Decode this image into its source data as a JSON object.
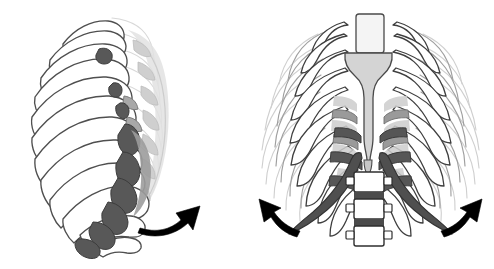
{
  "figure": {
    "caption": "Lateral and anterior views of the thoracic cage with arrows indicating rib elevation",
    "background_color": "#ffffff",
    "width": 494,
    "height": 269
  },
  "palette": {
    "background": "#ffffff",
    "bone_fill": "#ffffff",
    "bone_outline": "#4a4a4a",
    "bone_outline_faint": "#b9b9b9",
    "bone_outline_ghost": "#d6d6d6",
    "highlight_dark": "#585858",
    "highlight_mid": "#8d8d8d",
    "highlight_light": "#c9c9c9",
    "sternum_fill": "#d2d2d2",
    "cartilage_fill": "#bdbdbd",
    "arrow_fill": "#000000"
  },
  "panels": [
    {
      "id": "lateral-view",
      "label": "Lateral oblique view of rib cage",
      "position": "left",
      "ribs_visible": 12,
      "highlighted_ribs": [
        6,
        7,
        8,
        9,
        10
      ],
      "arrow": {
        "name": "rib-elevation-arrow-lateral",
        "direction": "up-and-right",
        "label": "Rib elevation direction"
      }
    },
    {
      "id": "anterior-view",
      "label": "Anterior view of rib cage",
      "position": "right",
      "ribs_visible": 12,
      "highlighted_ribs": [
        7,
        8,
        9,
        10
      ],
      "structures": [
        "manubrium",
        "sternal body",
        "xiphoid process",
        "costal cartilage",
        "costal margin",
        "lumbar vertebrae"
      ],
      "vertebrae_count": 3,
      "arrows": [
        {
          "name": "rib-elevation-arrow-anterior-left",
          "direction": "up-and-left",
          "label": "Left rib elevation direction"
        },
        {
          "name": "rib-elevation-arrow-anterior-right",
          "direction": "up-and-right",
          "label": "Right rib elevation direction"
        }
      ]
    }
  ]
}
